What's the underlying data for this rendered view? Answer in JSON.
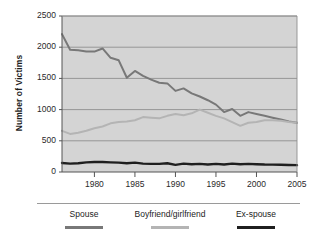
{
  "chart_data": {
    "type": "line",
    "title": "",
    "xlabel": "",
    "ylabel": "Number of Victims",
    "xlim": [
      1976,
      2005
    ],
    "ylim": [
      0,
      2500
    ],
    "grid": true,
    "legend_position": "bottom",
    "x": [
      1976,
      1977,
      1978,
      1979,
      1980,
      1981,
      1982,
      1983,
      1984,
      1985,
      1986,
      1987,
      1988,
      1989,
      1990,
      1991,
      1992,
      1993,
      1994,
      1995,
      1996,
      1997,
      1998,
      1999,
      2000,
      2001,
      2002,
      2003,
      2004,
      2005
    ],
    "xticks": [
      1980,
      1985,
      1990,
      1995,
      2000,
      2005
    ],
    "yticks": [
      0,
      500,
      1000,
      1500,
      2000,
      2500
    ],
    "series": [
      {
        "name": "Spouse",
        "color": "#787878",
        "values": [
          2210,
          1960,
          1950,
          1930,
          1930,
          1980,
          1830,
          1790,
          1510,
          1620,
          1540,
          1480,
          1430,
          1420,
          1300,
          1340,
          1260,
          1210,
          1150,
          1080,
          960,
          1010,
          900,
          960,
          930,
          900,
          870,
          840,
          810,
          790
        ]
      },
      {
        "name": "Boyfriend/girlfriend",
        "color": "#b4b4b4",
        "values": [
          660,
          610,
          630,
          660,
          700,
          730,
          780,
          800,
          810,
          830,
          880,
          870,
          860,
          900,
          930,
          910,
          940,
          1000,
          950,
          900,
          860,
          800,
          740,
          790,
          800,
          830,
          830,
          820,
          800,
          790
        ]
      },
      {
        "name": "Ex-spouse",
        "color": "#1f1f1f",
        "values": [
          145,
          135,
          140,
          155,
          160,
          160,
          155,
          150,
          140,
          150,
          135,
          130,
          130,
          140,
          115,
          135,
          125,
          130,
          120,
          130,
          120,
          135,
          125,
          130,
          125,
          120,
          118,
          115,
          112,
          110
        ]
      }
    ]
  },
  "axis": {
    "y_title": "Number of Victims",
    "y_tick_labels": [
      "0",
      "500",
      "1000",
      "1500",
      "2000",
      "2500"
    ],
    "x_tick_labels": [
      "1980",
      "1985",
      "1990",
      "1995",
      "2000",
      "2005"
    ]
  },
  "legend": {
    "entries": [
      {
        "label": "Spouse",
        "color": "#787878"
      },
      {
        "label": "Boyfriend/girlfriend",
        "color": "#b4b4b4"
      },
      {
        "label": "Ex-spouse",
        "color": "#1f1f1f"
      }
    ]
  },
  "style": {
    "plot_background": "#d4d4d4",
    "gridline_color": "#8e8e8e",
    "axis_color": "#555555",
    "page_background": "#ffffff"
  }
}
